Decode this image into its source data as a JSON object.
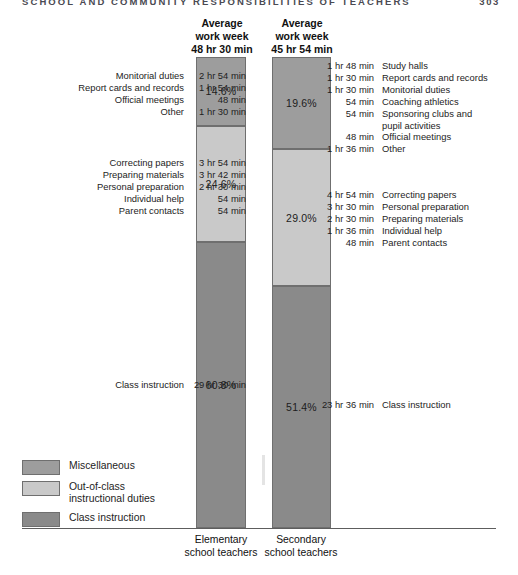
{
  "page": {
    "running_head": "SCHOOL AND COMMUNITY RESPONSIBILITIES OF TEACHERS",
    "folio": "303"
  },
  "legend": {
    "items": [
      {
        "label": "Miscellaneous",
        "color": "#9d9d9d",
        "key": "misc"
      },
      {
        "label": "Out-of-class\ninstructional duties",
        "line1": "Out-of-class",
        "line2": "instructional duties",
        "color": "#c9c9c9",
        "key": "ooc"
      },
      {
        "label": "Class instruction",
        "color": "#8a8a8a",
        "key": "cls"
      }
    ]
  },
  "chart_data": {
    "type": "bar",
    "subtype": "stacked-100-percent",
    "title": "",
    "xlabel": "",
    "ylabel": "",
    "ylim": [
      0,
      100
    ],
    "grid": false,
    "legend_position": "bottom-left",
    "categories": [
      "Elementary school teachers",
      "Secondary school teachers"
    ],
    "series": [
      {
        "name": "Miscellaneous",
        "color": "#9d9d9d",
        "values": [
          14.6,
          19.6
        ]
      },
      {
        "name": "Out-of-class instructional duties",
        "color": "#c9c9c9",
        "values": [
          24.6,
          29.0
        ]
      },
      {
        "name": "Class instruction",
        "color": "#8a8a8a",
        "values": [
          60.8,
          51.4
        ]
      }
    ],
    "columns": [
      {
        "id": "elementary",
        "caption_line1": "Average",
        "caption_line2": "work week",
        "caption_line3": "48 hr 30 min",
        "total": "48 hr 30 min",
        "axis_line1": "Elementary",
        "axis_line2": "school teachers",
        "segments": [
          {
            "key": "misc",
            "percent": "14.6%",
            "value": 14.6,
            "items": [
              {
                "name": "Monitorial duties",
                "time": "2 hr 54 min"
              },
              {
                "name": "Report cards and records",
                "time": "1 hr 54 min"
              },
              {
                "name": "Official meetings",
                "time": "48 min"
              },
              {
                "name": "Other",
                "time": "1 hr 30 min"
              }
            ]
          },
          {
            "key": "ooc",
            "percent": "24.6%",
            "value": 24.6,
            "items": [
              {
                "name": "Correcting papers",
                "time": "3 hr 54 min"
              },
              {
                "name": "Preparing materials",
                "time": "3 hr 42 min"
              },
              {
                "name": "Personal preparation",
                "time": "2 hr 30 min"
              },
              {
                "name": "Individual help",
                "time": "54 min"
              },
              {
                "name": "Parent contacts",
                "time": "54 min"
              }
            ]
          },
          {
            "key": "cls",
            "percent": "60.8%",
            "value": 60.8,
            "items": [
              {
                "name": "Class instruction",
                "time": "29 hr 30 min"
              }
            ]
          }
        ]
      },
      {
        "id": "secondary",
        "caption_line1": "Average",
        "caption_line2": "work week",
        "caption_line3": "45 hr 54 min",
        "total": "45 hr 54 min",
        "axis_line1": "Secondary",
        "axis_line2": "school teachers",
        "segments": [
          {
            "key": "misc",
            "percent": "19.6%",
            "value": 19.6,
            "items": [
              {
                "name": "Study halls",
                "time": "1 hr 48 min"
              },
              {
                "name": "Report cards and records",
                "time": "1 hr 30 min"
              },
              {
                "name": "Monitorial duties",
                "time": "1 hr 30 min"
              },
              {
                "name": "Coaching athletics",
                "time": "54 min"
              },
              {
                "name": "Sponsoring clubs and",
                "name2": "pupil activities",
                "time": "54 min"
              },
              {
                "name": "Official meetings",
                "time": "48 min"
              },
              {
                "name": "Other",
                "time": "1 hr 36 min"
              }
            ]
          },
          {
            "key": "ooc",
            "percent": "29.0%",
            "value": 29.0,
            "items": [
              {
                "name": "Correcting papers",
                "time": "4 hr 54 min"
              },
              {
                "name": "Personal preparation",
                "time": "3 hr 30 min"
              },
              {
                "name": "Preparing materials",
                "time": "2 hr 30 min"
              },
              {
                "name": "Individual help",
                "time": "1 hr 36 min"
              },
              {
                "name": "Parent contacts",
                "time": "48 min"
              }
            ]
          },
          {
            "key": "cls",
            "percent": "51.4%",
            "value": 51.4,
            "items": [
              {
                "name": "Class instruction",
                "time": "23 hr 36 min"
              }
            ]
          }
        ]
      }
    ]
  }
}
